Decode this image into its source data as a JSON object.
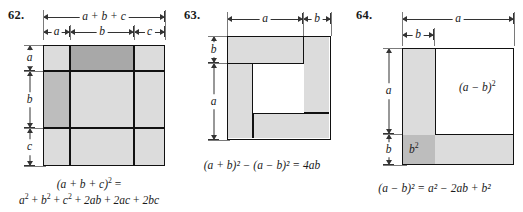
{
  "page": {
    "background": "#ffffff",
    "ink": "#111111",
    "rule_color": "#333333"
  },
  "palette": {
    "shade_light": "#dcdcdc",
    "shade_medium": "#c2c2c2",
    "shade_dark": "#a8a8a8",
    "white": "#ffffff",
    "outline": "#111111"
  },
  "problems": [
    {
      "number": "62.",
      "figure_type": "3x3-square-grid",
      "top_rulers": [
        {
          "label": "a + b + c",
          "span": "full"
        },
        {
          "label": "a",
          "span": "a"
        },
        {
          "label": "b",
          "span": "b"
        },
        {
          "label": "c",
          "span": "c"
        }
      ],
      "left_rulers": [
        {
          "label": "a"
        },
        {
          "label": "b"
        },
        {
          "label": "c"
        }
      ],
      "grid": {
        "cols": [
          "a",
          "b",
          "c"
        ],
        "rows": [
          "a",
          "b",
          "c"
        ],
        "cells": [
          {
            "row": "a",
            "col": "a",
            "area": "a2",
            "shade": "shade_light"
          },
          {
            "row": "a",
            "col": "b",
            "area": "ab",
            "shade": "shade_dark"
          },
          {
            "row": "a",
            "col": "c",
            "area": "ac",
            "shade": "shade_light"
          },
          {
            "row": "b",
            "col": "a",
            "area": "ab",
            "shade": "shade_medium"
          },
          {
            "row": "b",
            "col": "b",
            "area": "b2",
            "shade": "shade_light"
          },
          {
            "row": "b",
            "col": "c",
            "area": "bc",
            "shade": "shade_light"
          },
          {
            "row": "c",
            "col": "a",
            "area": "ac",
            "shade": "shade_light"
          },
          {
            "row": "c",
            "col": "b",
            "area": "bc",
            "shade": "shade_light"
          },
          {
            "row": "c",
            "col": "c",
            "area": "c2",
            "shade": "shade_light"
          }
        ]
      },
      "caption_line1": "(a + b + c)",
      "caption_line1_exp": "2",
      "caption_line1_tail": " =",
      "caption_line2_parts": [
        {
          "base": "a",
          "exp": "2"
        },
        {
          "op": " + "
        },
        {
          "base": "b",
          "exp": "2"
        },
        {
          "op": " + "
        },
        {
          "base": "c",
          "exp": "2"
        },
        {
          "op": " + "
        },
        {
          "base": "2ab",
          "exp": ""
        },
        {
          "op": " + "
        },
        {
          "base": "2ac",
          "exp": ""
        },
        {
          "op": " + "
        },
        {
          "base": "2bc",
          "exp": ""
        }
      ]
    },
    {
      "number": "63.",
      "figure_type": "pinwheel-frame",
      "top_rulers": [
        {
          "label": "a",
          "span": "a"
        },
        {
          "label": "b",
          "span": "b"
        }
      ],
      "left_rulers": [
        {
          "label": "b"
        },
        {
          "label": "a"
        }
      ],
      "regions": [
        {
          "name": "top-strip",
          "shade": "shade_light"
        },
        {
          "name": "right-strip",
          "shade": "shade_light"
        },
        {
          "name": "bottom-strip",
          "shade": "shade_light"
        },
        {
          "name": "left-strip",
          "shade": "shade_light"
        },
        {
          "name": "center-hole",
          "shade": "white"
        }
      ],
      "caption": "(a + b)² − (a − b)² = 4ab"
    },
    {
      "number": "64.",
      "figure_type": "square-minus-L",
      "top_rulers": [
        {
          "label": "a",
          "span": "a"
        },
        {
          "label": "b",
          "span": "b"
        }
      ],
      "left_rulers": [
        {
          "label": "a"
        },
        {
          "label": "b"
        }
      ],
      "regions": [
        {
          "name": "inner-square",
          "shade": "white",
          "label": "(a − b)²"
        },
        {
          "name": "left-strip",
          "shade": "shade_light",
          "label": ""
        },
        {
          "name": "bottom-strip",
          "shade": "shade_light",
          "label": ""
        },
        {
          "name": "corner-b2",
          "shade": "shade_dark",
          "label": "b²"
        }
      ],
      "inner_label": "(a − b)",
      "inner_label_exp": "2",
      "corner_label": "b",
      "corner_label_exp": "2",
      "caption": "(a − b)² = a² − 2ab + b²"
    }
  ]
}
